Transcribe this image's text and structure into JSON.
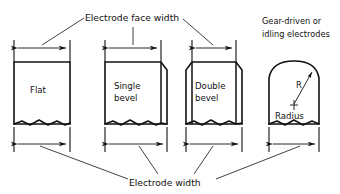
{
  "diagram": {
    "title_top": "Electrode face width",
    "title_bottom": "Electrode width",
    "note_line1": "Gear-driven or",
    "note_line2": "idling electrodes",
    "ink_color": "#111111",
    "background_color": "#ffffff"
  },
  "electrodes": [
    {
      "id": "flat",
      "label_line1": "Flat",
      "label_line2": "",
      "face_type": "flat",
      "face_width_dim": "Electrode face width",
      "body_width_dim": "Electrode width"
    },
    {
      "id": "single-bevel",
      "label_line1": "Single",
      "label_line2": "bevel",
      "face_type": "single bevel",
      "face_width_dim": "Electrode face width",
      "body_width_dim": "Electrode width"
    },
    {
      "id": "double-bevel",
      "label_line1": "Double",
      "label_line2": "bevel",
      "face_type": "double bevel",
      "face_width_dim": "Electrode face width",
      "body_width_dim": "Electrode width"
    },
    {
      "id": "radius",
      "label_line1": "Radius",
      "label_line2": "",
      "face_type": "radius",
      "radius_symbol": "R",
      "body_width_dim": "Electrode width"
    }
  ]
}
